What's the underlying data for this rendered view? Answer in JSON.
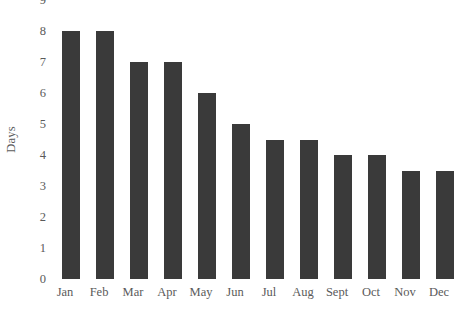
{
  "chart_data": {
    "type": "bar",
    "title": "",
    "xlabel": "",
    "ylabel": "Days",
    "categories": [
      "Jan",
      "Feb",
      "Mar",
      "Apr",
      "May",
      "Jun",
      "Jul",
      "Aug",
      "Sept",
      "Oct",
      "Nov",
      "Dec"
    ],
    "values": [
      8,
      8,
      7,
      7,
      6,
      5,
      4.5,
      4.5,
      4,
      4,
      3.5,
      3.5
    ],
    "ylim": [
      0,
      9
    ],
    "ytick_labels": [
      "9",
      "8",
      "7",
      "6",
      "5",
      "4",
      "3",
      "2",
      "1",
      "0"
    ],
    "ytick_values": [
      9,
      8,
      7,
      6,
      5,
      4,
      3,
      2,
      1,
      0
    ],
    "grid": false,
    "legend": false,
    "bar_color": "#3a3a3a",
    "text_color": "#5a5a5a",
    "background_color": "#ffffff"
  }
}
